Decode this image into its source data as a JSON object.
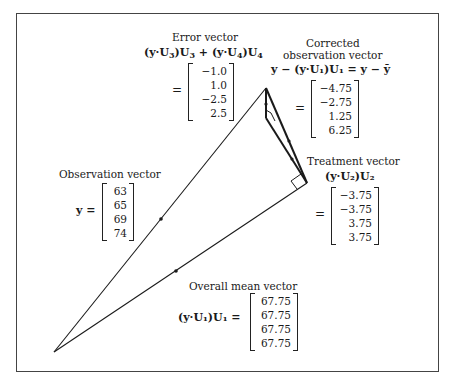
{
  "error": {
    "title": "Error vector",
    "formula_a": "(y·U",
    "sub3": "3",
    "formula_b": ")U",
    "formula_c": " + (y·U",
    "sub4": "4",
    "formula_d": ")U",
    "eq": "=",
    "values": [
      "−1.0",
      "1.0",
      "−2.5",
      "2.5"
    ]
  },
  "corrected": {
    "title1": "Corrected",
    "title2": "observation vector",
    "formula": "y − (y·U₁)U₁ = y − ȳ",
    "eq": "=",
    "values": [
      "−4.75",
      "−2.75",
      "1.25",
      "6.25"
    ]
  },
  "treatment": {
    "title": "Treatment vector",
    "formula": "(y·U₂)U₂",
    "eq": "=",
    "values": [
      "−3.75",
      "−3.75",
      "3.75",
      "3.75"
    ]
  },
  "observation": {
    "title": "Observation vector",
    "formula": "y =",
    "values": [
      "63",
      "65",
      "69",
      "74"
    ]
  },
  "mean": {
    "title": "Overall mean vector",
    "formula": "(y·U₁)U₁ =",
    "values": [
      "67.75",
      "67.75",
      "67.75",
      "67.75"
    ]
  },
  "geometry": {
    "origin": [
      54,
      352
    ],
    "apex": [
      266,
      88
    ],
    "mean_end": [
      307,
      183
    ],
    "treatment_end": [
      266,
      118
    ],
    "line_color": "#1a1a1a"
  }
}
